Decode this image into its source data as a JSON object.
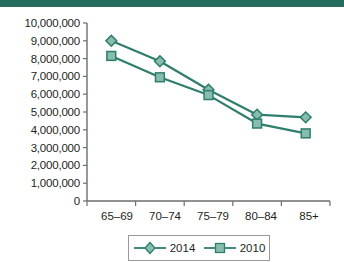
{
  "header": {
    "band_color": "#256d5e"
  },
  "chart_data": {
    "type": "line",
    "title": "",
    "xlabel": "",
    "ylabel": "",
    "categories": [
      "65–69",
      "70–74",
      "75–79",
      "80–84",
      "85+"
    ],
    "ylim": [
      0,
      10000000
    ],
    "ytick_step": 1000000,
    "ytick_labels": [
      "10,000,000",
      "9,000,000",
      "8,000,000",
      "7,000,000",
      "6,000,000",
      "5,000,000",
      "4,000,000",
      "3,000,000",
      "2,000,000",
      "1,000,000",
      "0"
    ],
    "grid": false,
    "legend_position": "bottom",
    "series": [
      {
        "name": "2014",
        "marker": "diamond",
        "color": "#2f7d6c",
        "fill": "#86bdae",
        "values": [
          9000000,
          7850000,
          6250000,
          4850000,
          4700000
        ]
      },
      {
        "name": "2010",
        "marker": "square",
        "color": "#2f7d6c",
        "fill": "#86bdae",
        "values": [
          8150000,
          6950000,
          5950000,
          4350000,
          3800000
        ]
      }
    ]
  },
  "legend": {
    "items": [
      {
        "label": "2014",
        "marker": "diamond-marker"
      },
      {
        "label": "2010",
        "marker": "square-marker"
      }
    ]
  },
  "axis": {
    "line_color": "#6d6d6d"
  }
}
